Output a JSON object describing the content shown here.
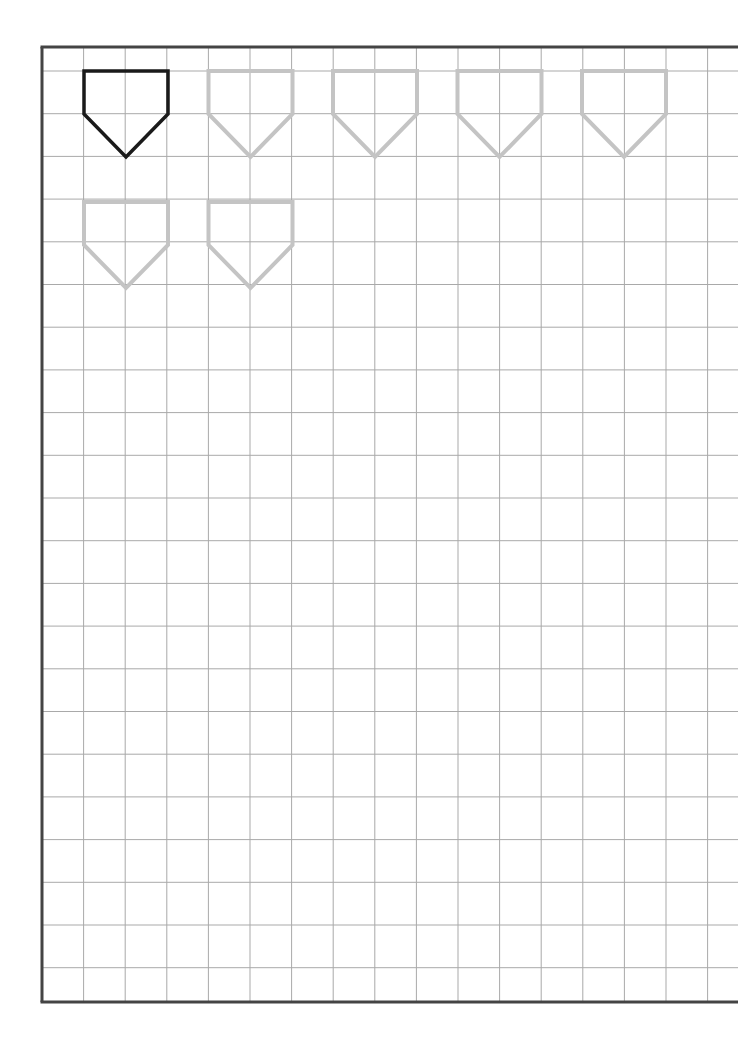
{
  "worksheet": {
    "title": "",
    "grid": {
      "left": 42,
      "top": 47,
      "bottom": 1002,
      "right": 738,
      "cell": 41.6,
      "first_h_line": 71,
      "h_spacing": 42.7,
      "line_color": "#a9a9a9",
      "border_color": "#444444"
    },
    "shapes": [
      {
        "row": 1,
        "index": 1,
        "kind": "pentagon-home-plate",
        "style": "solid",
        "color": "#1a1a1a"
      },
      {
        "row": 1,
        "index": 2,
        "kind": "pentagon-home-plate",
        "style": "trace",
        "color": "#c4c4c4"
      },
      {
        "row": 1,
        "index": 3,
        "kind": "pentagon-home-plate",
        "style": "trace",
        "color": "#c4c4c4"
      },
      {
        "row": 1,
        "index": 4,
        "kind": "pentagon-home-plate",
        "style": "trace",
        "color": "#c4c4c4"
      },
      {
        "row": 1,
        "index": 5,
        "kind": "pentagon-home-plate",
        "style": "trace",
        "color": "#c4c4c4"
      },
      {
        "row": 2,
        "index": 1,
        "kind": "pentagon-home-plate",
        "style": "trace",
        "color": "#c4c4c4"
      },
      {
        "row": 2,
        "index": 2,
        "kind": "pentagon-home-plate",
        "style": "trace",
        "color": "#c4c4c4"
      }
    ]
  }
}
